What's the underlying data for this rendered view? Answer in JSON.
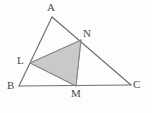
{
  "figure": {
    "background_color": "#fdfdfd",
    "stroke_color": "#6e6e6e",
    "shade_fill_color": "#c9c9c9",
    "shade_stroke_color": "#8a8a8a",
    "label_color": "#4a4a4a",
    "stroke_width": 1.1
  },
  "labels": {
    "a": "A",
    "b": "B",
    "c": "C",
    "l": "L",
    "m": "M",
    "n": "N"
  },
  "chart_data": {
    "type": "diagram",
    "points": [
      {
        "name": "A",
        "x": 52,
        "y": 17,
        "label_x": 47,
        "label_y": 2
      },
      {
        "name": "B",
        "x": 19,
        "y": 86,
        "label_x": 7,
        "label_y": 80
      },
      {
        "name": "C",
        "x": 131,
        "y": 85,
        "label_x": 133,
        "label_y": 79
      },
      {
        "name": "L",
        "x": 30,
        "y": 63,
        "label_x": 17,
        "label_y": 55
      },
      {
        "name": "M",
        "x": 76,
        "y": 86,
        "label_x": 71,
        "label_y": 88
      },
      {
        "name": "N",
        "x": 81,
        "y": 40,
        "label_x": 83,
        "label_y": 28
      }
    ],
    "segments": [
      {
        "name": "AB",
        "from": "A",
        "to": "B"
      },
      {
        "name": "AC",
        "from": "A",
        "to": "C"
      },
      {
        "name": "BC",
        "from": "B",
        "to": "C"
      },
      {
        "name": "LN",
        "from": "L",
        "to": "N"
      },
      {
        "name": "NM",
        "from": "N",
        "to": "M"
      },
      {
        "name": "ML",
        "from": "M",
        "to": "L"
      }
    ],
    "shaded_regions": [
      {
        "name": "triangle-LNM",
        "vertices": [
          "L",
          "N",
          "M"
        ],
        "fill": "#c9c9c9"
      }
    ]
  }
}
